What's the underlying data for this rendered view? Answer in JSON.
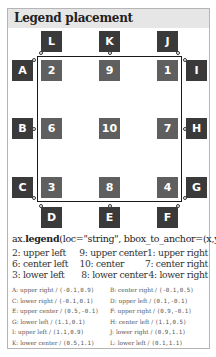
{
  "title": "Legend placement",
  "colors": {
    "outer_box": "#3a3a3a",
    "inner_box": "#5f5f5f",
    "axes_border": "#1a1a1a",
    "header_bg": "#e6e6e6",
    "panel_border": "#b5b5b5"
  },
  "outer_boxes": {
    "A": "A",
    "B": "B",
    "C": "C",
    "D": "D",
    "E": "E",
    "F": "F",
    "G": "G",
    "H": "H",
    "I": "I",
    "J": "J",
    "K": "K",
    "L": "L"
  },
  "inner_boxes": {
    "upper_left": "2",
    "upper_center": "9",
    "upper_right": "1",
    "center_left": "6",
    "center": "10",
    "center_right": "7",
    "lower_left": "3",
    "lower_center": "8",
    "lower_right": "4"
  },
  "code": {
    "prefix": "ax.",
    "func": "legend",
    "args": "(loc=\"string\", bbox_to_anchor=(x,y))"
  },
  "locations": [
    [
      "2: upper left",
      "9: upper center",
      "1: upper right"
    ],
    [
      "6: center left",
      "10: center",
      "7: center right"
    ],
    [
      "3: lower left",
      "8: lower center",
      "4: lower right"
    ]
  ],
  "anchors": [
    [
      {
        "label": "A: upper right / ",
        "coords": "(-0.1,0.9)"
      },
      {
        "label": "B: center right / ",
        "coords": "(-0.1,0.5)"
      }
    ],
    [
      {
        "label": "C: lower right / ",
        "coords": "(-0.1,0.1)"
      },
      {
        "label": "D: upper left / ",
        "coords": "(0.1,-0.1)"
      }
    ],
    [
      {
        "label": "E: upper center / ",
        "coords": "(0.5,-0.1)"
      },
      {
        "label": "F: upper right / ",
        "coords": "(0.9,-0.1)"
      }
    ],
    [
      {
        "label": "G: lower left / ",
        "coords": "(1.1,0.1)"
      },
      {
        "label": "H: center left / ",
        "coords": "(1.1,0.5)"
      }
    ],
    [
      {
        "label": "I: upper left / ",
        "coords": "(1.1,0.9)"
      },
      {
        "label": "J: lower right / ",
        "coords": "(0.9,1.1)"
      }
    ],
    [
      {
        "label": "K: lower center / ",
        "coords": "(0.5,1.1)"
      },
      {
        "label": "L: lower left / ",
        "coords": "(0.1,1.1)"
      }
    ]
  ]
}
